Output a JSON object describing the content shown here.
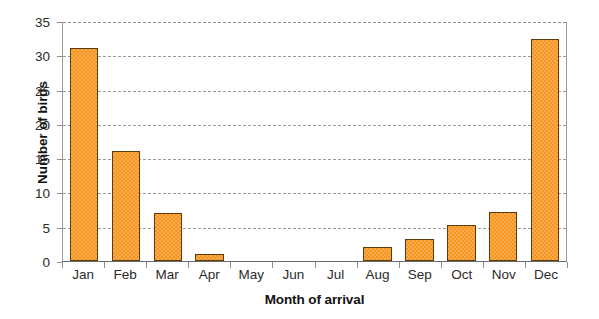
{
  "chart_data": {
    "type": "bar",
    "title": "",
    "xlabel": "Month of arrival",
    "ylabel": "Number of birds",
    "categories": [
      "Jan",
      "Feb",
      "Mar",
      "Apr",
      "May",
      "Jun",
      "Jul",
      "Aug",
      "Sep",
      "Oct",
      "Nov",
      "Dec"
    ],
    "values": [
      31,
      16,
      7,
      1,
      0,
      0,
      0,
      2,
      3.2,
      5.2,
      7.2,
      32.4
    ],
    "series": [
      {
        "name": "Number of birds",
        "values": [
          31,
          16,
          7,
          1,
          0,
          0,
          0,
          2,
          3.2,
          5.2,
          7.2,
          32.4
        ]
      }
    ],
    "ylim": [
      0,
      35
    ],
    "yticks": [
      0,
      5,
      10,
      15,
      20,
      25,
      30,
      35
    ],
    "ytick_labels": [
      "0",
      "5",
      "10",
      "15",
      "20",
      "25",
      "30",
      "35"
    ],
    "grid": true,
    "grid_axis": "y",
    "grid_style": "dashed",
    "legend": false,
    "legend_position": "none",
    "bar_fill_color": "#F7941E",
    "bar_edge_color": "#5B3A0C",
    "gridline_color": "#9A9A9A",
    "axis_color": "#8D8D8D",
    "background_color": "#FFFFFF"
  }
}
